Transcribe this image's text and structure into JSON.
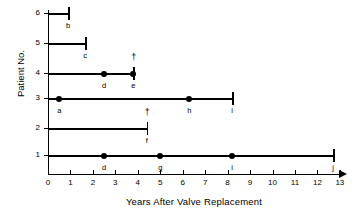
{
  "chart_data": {
    "type": "line",
    "title": "",
    "xlabel": "Years After Valve Replacement",
    "ylabel": "Patient No.",
    "xlim": [
      0,
      13.6
    ],
    "ylim": [
      0.4,
      6.4
    ],
    "grid": false,
    "legend": "none",
    "xticks": [
      0,
      1,
      2,
      3,
      4,
      5,
      6,
      7,
      8,
      9,
      10,
      11,
      12,
      13
    ],
    "xtick_labels": [
      "0",
      "1",
      "2",
      "3",
      "4",
      "5",
      "6",
      "7",
      "8",
      "9",
      "10",
      "11",
      "12",
      "13"
    ],
    "yticks": [
      1,
      2,
      3,
      4,
      5,
      6
    ],
    "ytick_labels": [
      "1",
      "2",
      "3",
      "4",
      "5",
      "6"
    ],
    "series": [
      {
        "name": "Patient 1",
        "patient": 1,
        "start": 0,
        "end": 12.7,
        "end_marker": "tick",
        "end_label": "j",
        "dagger": false,
        "events": [
          {
            "x": 2.5,
            "label": "d"
          },
          {
            "x": 5.0,
            "label": "g"
          },
          {
            "x": 8.2,
            "label": "i"
          }
        ]
      },
      {
        "name": "Patient 2",
        "patient": 2,
        "start": 0,
        "end": 4.4,
        "end_marker": "tick",
        "end_label": "f",
        "dagger": true,
        "events": []
      },
      {
        "name": "Patient 3",
        "patient": 3,
        "start": 0,
        "end": 8.2,
        "end_marker": "tick",
        "end_label": "i",
        "dagger": false,
        "events": [
          {
            "x": 0.5,
            "label": "a"
          },
          {
            "x": 6.3,
            "label": "h"
          }
        ]
      },
      {
        "name": "Patient 4",
        "patient": 4,
        "start": 0,
        "end": 3.8,
        "end_marker": "tick",
        "end_label": "e",
        "dagger": true,
        "events": [
          {
            "x": 2.5,
            "label": "d"
          },
          {
            "x": 3.8,
            "label": ""
          }
        ]
      },
      {
        "name": "Patient 5",
        "patient": 5,
        "start": 0,
        "end": 1.65,
        "end_marker": "tick",
        "end_label": "c",
        "dagger": false,
        "events": []
      },
      {
        "name": "Patient 6",
        "patient": 6,
        "start": 0,
        "end": 0.9,
        "end_marker": "tick",
        "end_label": "b",
        "dagger": false,
        "events": []
      }
    ],
    "symbols": {
      "dagger": "†",
      "dot": "●"
    }
  }
}
